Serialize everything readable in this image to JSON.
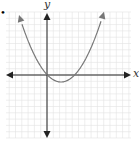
{
  "chart_data": {
    "type": "line",
    "title": "",
    "xlabel": "x",
    "ylabel": "y",
    "grid": true,
    "xlim": [
      -6.5,
      13.5
    ],
    "ylim": [
      -10,
      10
    ],
    "series": [
      {
        "name": "parabola",
        "equation": "y = 0.24x(x - 4.3)",
        "roots": [
          0,
          4.3
        ],
        "vertex": [
          2.15,
          -1.1
        ],
        "opens": "up",
        "end_arrows": true
      }
    ]
  },
  "labels": {
    "x_axis": "x",
    "y_axis": "y"
  },
  "marker_dot": "•",
  "colors": {
    "curve": "#777777",
    "axes": "#222222",
    "grid": "#e2e2e2"
  },
  "pixel_geometry": {
    "origin": [
      47,
      75
    ],
    "grid_left": 6,
    "grid_right": 131,
    "grid_top": 12,
    "grid_bottom": 138,
    "cell": 6.3,
    "curve_vertex_px": [
      61,
      82
    ],
    "curve_a_px": 0.038,
    "curve_x_range_px": [
      19,
      104
    ]
  }
}
